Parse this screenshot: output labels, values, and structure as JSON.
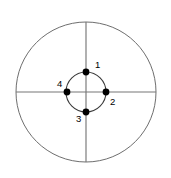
{
  "figure": {
    "background_color": "#ffffff",
    "outer_circle_color": "#6e6e6e",
    "inner_circle_color": "#3a3a3a",
    "axis_color": "#777777",
    "dot_color": "#000000",
    "label_color": "#000000"
  },
  "chart_data": {
    "type": "scatter",
    "title": "",
    "xlabel": "",
    "ylabel": "",
    "grid": false,
    "legend": "none",
    "center": {
      "x": 86,
      "y": 92
    },
    "outer_circle_radius": 70,
    "inner_circle_radius": 20,
    "axes": [
      {
        "name": "horizontal-diameter",
        "x1": 16,
        "y1": 92,
        "x2": 156,
        "y2": 92
      },
      {
        "name": "vertical-diameter",
        "x1": 86,
        "y1": 22,
        "x2": 86,
        "y2": 162
      }
    ],
    "categories": [
      "1",
      "2",
      "3",
      "4"
    ],
    "points": [
      {
        "label": "1",
        "position": "top",
        "x": 86,
        "y": 72,
        "angle_deg": 90,
        "label_x": 95,
        "label_y": 65
      },
      {
        "label": "2",
        "position": "right",
        "x": 106,
        "y": 92,
        "angle_deg": 0,
        "label_x": 110,
        "label_y": 102
      },
      {
        "label": "3",
        "position": "bottom",
        "x": 86,
        "y": 112,
        "angle_deg": 270,
        "label_x": 76,
        "label_y": 119
      },
      {
        "label": "4",
        "position": "left",
        "x": 67,
        "y": 92,
        "angle_deg": 180,
        "label_x": 57,
        "label_y": 84
      }
    ],
    "dot_radius": 3.4
  }
}
